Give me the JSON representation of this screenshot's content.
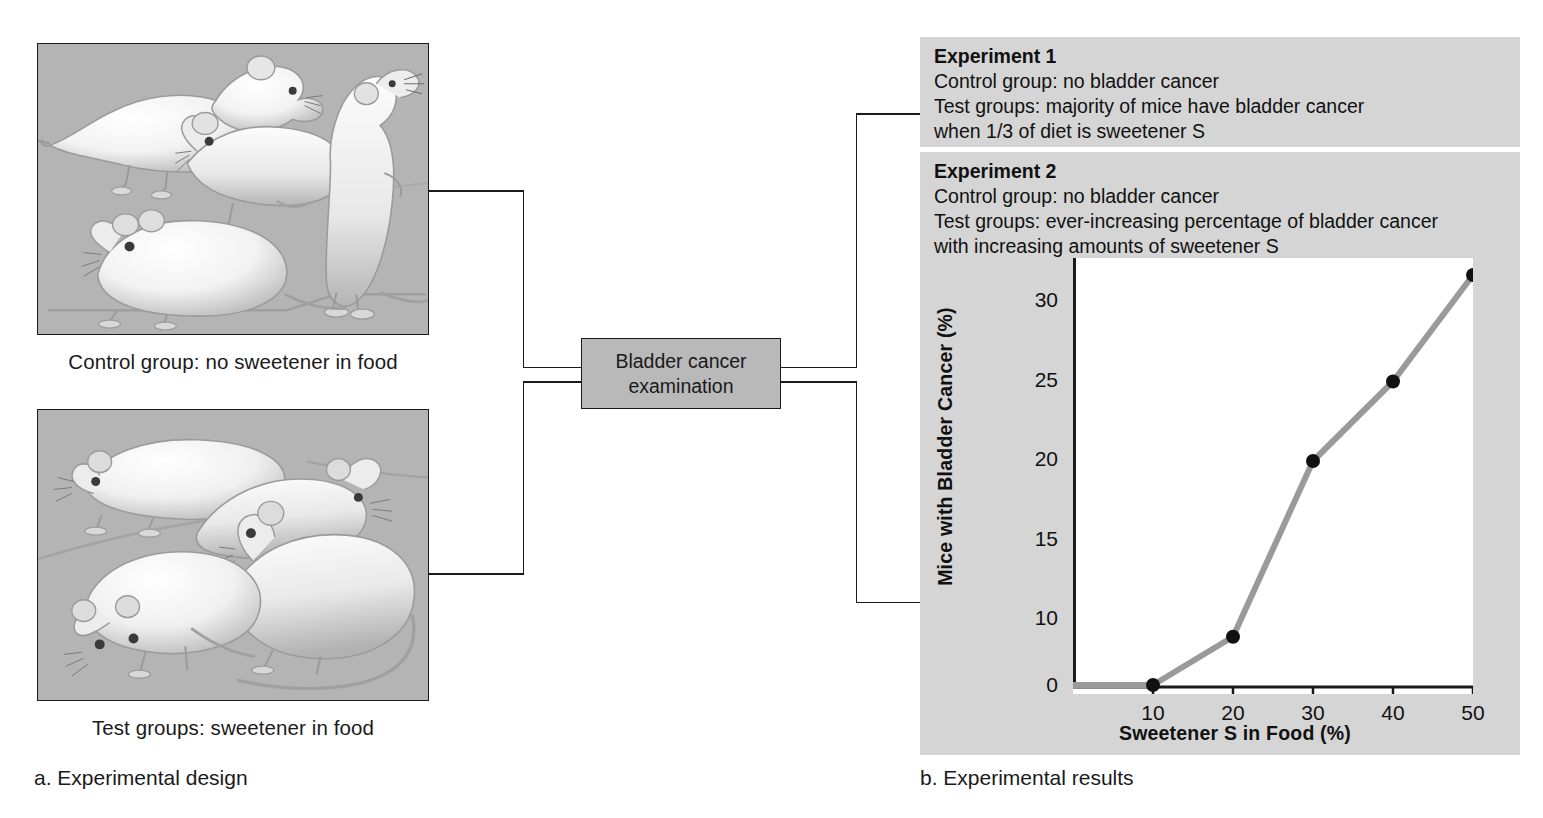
{
  "figure": {
    "part_a_label": "a. Experimental design",
    "part_b_label": "b. Experimental results"
  },
  "design": {
    "control_caption": "Control group: no sweetener in food",
    "test_caption": "Test groups: sweetener in food",
    "control_panel_name": "control-group-mice-illustration",
    "test_panel_name": "test-group-mice-illustration",
    "exam_box_line1": "Bladder cancer",
    "exam_box_line2": "examination"
  },
  "results": {
    "experiment1": {
      "title": "Experiment 1",
      "line1": "Control group: no bladder cancer",
      "line2": "Test groups: majority of mice have bladder cancer",
      "line3": "when 1/3 of diet is sweetener S"
    },
    "experiment2": {
      "title": "Experiment 2",
      "line1": "Control group: no bladder cancer",
      "line2": "Test groups: ever-increasing percentage of bladder cancer",
      "line3": "with increasing amounts of sweetener S"
    }
  },
  "chart_data": {
    "type": "line",
    "title": "",
    "xlabel": "Sweetener S in Food (%)",
    "ylabel": "Mice with Bladder Cancer (%)",
    "x": [
      10,
      20,
      30,
      40,
      50
    ],
    "values": [
      0.3,
      7.5,
      20,
      25,
      31.7
    ],
    "series": [
      {
        "name": "Mice with bladder cancer",
        "points": [
          {
            "x": 10,
            "y": 0.3
          },
          {
            "x": 20,
            "y": 7.5
          },
          {
            "x": 30,
            "y": 20
          },
          {
            "x": 40,
            "y": 25
          },
          {
            "x": 50,
            "y": 31.7
          }
        ]
      }
    ],
    "xticks": [
      10,
      20,
      30,
      40,
      50
    ],
    "xtick_labels": [
      "10",
      "20",
      "30",
      "40",
      "50"
    ],
    "yticks": [
      0,
      10,
      15,
      20,
      25,
      30
    ],
    "ytick_labels": [
      "0",
      "10",
      "15",
      "20",
      "25",
      "30"
    ],
    "xlim": [
      0,
      50
    ],
    "ylim": [
      0,
      33
    ],
    "grid": false,
    "legend": "none",
    "note": "y-axis scale is compressed between 0 and 10",
    "line_color": "#9a9a9a",
    "marker_color": "#111111"
  },
  "colors": {
    "panel_gray": "#d5d5d5",
    "illustration_gray": "#b4b4b4",
    "box_gray": "#b9b9b9",
    "line_black": "#1a1a1a",
    "plot_line": "#9a9a9a"
  }
}
